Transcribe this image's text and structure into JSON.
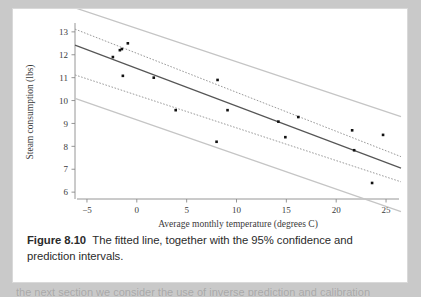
{
  "figure": {
    "caption_label": "Figure 8.10",
    "caption_text": "The fitted line, together with the 95% confidence and prediction intervals.",
    "page_tail_text": "the next section we consider the use of inverse prediction and calibration"
  },
  "colors": {
    "page_background": "#c9c9c9",
    "panel_background": "#ffffff",
    "point": "#111111",
    "fit_line": "#555555",
    "confidence_band": "#9a9a9a",
    "prediction_band": "#c5c5c5",
    "axis": "#8a8a8a",
    "text": "#3a3a3a"
  },
  "chart_data": {
    "type": "scatter",
    "title": "",
    "xlabel": "Average monthly  temperature (degrees C)",
    "ylabel": "Steam consumption (lbs)",
    "xlim": [
      -6.2,
      26.5
    ],
    "ylim": [
      5.7,
      13.3
    ],
    "xticks": [
      -5,
      0,
      5,
      10,
      15,
      20,
      25
    ],
    "xticklabels": [
      "−5",
      "0",
      "5",
      "10",
      "15",
      "20",
      "25"
    ],
    "yticks": [
      6,
      7,
      8,
      9,
      10,
      11,
      12,
      13
    ],
    "yticklabels": [
      "6",
      "7",
      "8",
      "9",
      "10",
      "11",
      "12",
      "13"
    ],
    "grid": false,
    "legend": "none",
    "x": [
      -2.4,
      -1.7,
      -1.5,
      -0.9,
      -1.4,
      1.7,
      3.9,
      8.1,
      8.0,
      9.1,
      14.2,
      14.9,
      16.2,
      21.6,
      21.8,
      23.6,
      24.7
    ],
    "y": [
      11.9,
      12.2,
      12.25,
      12.5,
      11.08,
      11.0,
      9.58,
      10.9,
      8.2,
      9.58,
      9.08,
      8.4,
      9.28,
      8.7,
      7.83,
      6.4,
      8.5
    ],
    "fit_line": {
      "name": "fitted line",
      "style": "solid",
      "x": [
        -6.2,
        26.5
      ],
      "y": [
        12.42,
        7.05
      ],
      "slope": -0.164,
      "intercept": 11.405
    },
    "confidence_interval": {
      "name": "95% confidence interval",
      "style": "dotted",
      "upper": {
        "x": [
          -6.2,
          26.5
        ],
        "y": [
          13.12,
          7.55
        ]
      },
      "lower": {
        "x": [
          -6.2,
          26.5
        ],
        "y": [
          11.12,
          6.45
        ]
      }
    },
    "prediction_interval": {
      "name": "95% prediction interval",
      "style": "solid-light",
      "upper": {
        "x": [
          -6.2,
          26.5
        ],
        "y": [
          14.05,
          9.3
        ]
      },
      "lower": {
        "x": [
          -6.2,
          26.5
        ],
        "y": [
          10.1,
          5.15
        ]
      }
    }
  }
}
